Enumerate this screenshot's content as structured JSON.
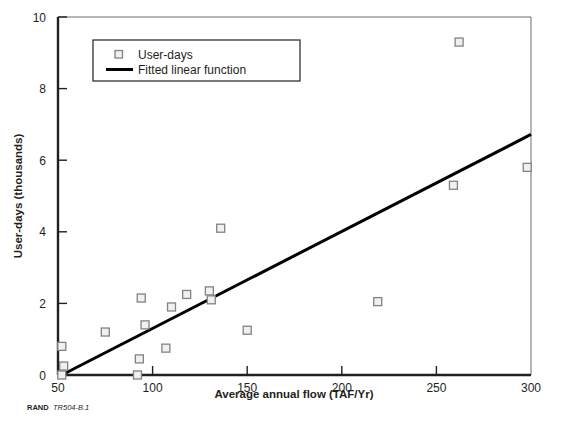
{
  "figure": {
    "credit_prefix": "RAND",
    "credit_id": "TR504-B.1",
    "background_color": "#ffffff"
  },
  "chart_data": {
    "type": "scatter",
    "title": "",
    "xlabel": "Average annual flow (TAF/Yr)",
    "ylabel": "User-days (thousands)",
    "xlim": [
      50,
      300
    ],
    "ylim": [
      0,
      10
    ],
    "xticks": [
      50,
      100,
      150,
      200,
      250,
      300
    ],
    "xtick_labels": [
      "50",
      "100",
      "150",
      "200",
      "250",
      "300"
    ],
    "yticks": [
      0,
      2,
      4,
      6,
      8,
      10
    ],
    "ytick_labels": [
      "0",
      "2",
      "4",
      "6",
      "8",
      "10"
    ],
    "grid": false,
    "legend_position": "upper-left",
    "marker_color": "#f0f0f0",
    "marker_edge_color": "#808285",
    "line_color": "#000000",
    "series": [
      {
        "name": "User-days",
        "type": "scatter",
        "marker": "square",
        "points": [
          {
            "x": 52,
            "y": 0.0
          },
          {
            "x": 52,
            "y": 0.8
          },
          {
            "x": 53,
            "y": 0.25
          },
          {
            "x": 75,
            "y": 1.2
          },
          {
            "x": 92,
            "y": 0.0
          },
          {
            "x": 93,
            "y": 0.45
          },
          {
            "x": 94,
            "y": 2.15
          },
          {
            "x": 96,
            "y": 1.4
          },
          {
            "x": 107,
            "y": 0.75
          },
          {
            "x": 110,
            "y": 1.9
          },
          {
            "x": 118,
            "y": 2.25
          },
          {
            "x": 130,
            "y": 2.35
          },
          {
            "x": 131,
            "y": 2.1
          },
          {
            "x": 136,
            "y": 4.1
          },
          {
            "x": 150,
            "y": 1.25
          },
          {
            "x": 219,
            "y": 2.05
          },
          {
            "x": 259,
            "y": 5.3
          },
          {
            "x": 262,
            "y": 9.3
          },
          {
            "x": 298,
            "y": 5.8
          }
        ]
      },
      {
        "name": "Fitted linear function",
        "type": "line",
        "endpoints": [
          {
            "x": 52,
            "y": 0.0
          },
          {
            "x": 300,
            "y": 6.72
          }
        ]
      }
    ],
    "legend": [
      {
        "label": "User-days",
        "marker": "square"
      },
      {
        "label": "Fitted linear function",
        "marker": "line"
      }
    ]
  }
}
